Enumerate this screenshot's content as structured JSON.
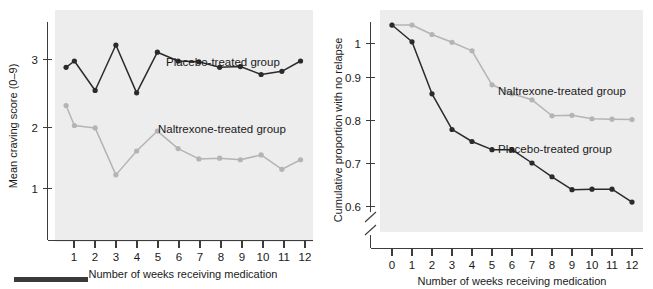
{
  "figure": {
    "background_color": "#ffffff",
    "plot_background_color": "#ededed",
    "caption_bar_label": "caption-rule"
  },
  "colors": {
    "placebo": "#2b2b2b",
    "naltrexone": "#b4b4b4",
    "axis": "#3c3c3c",
    "plot_bg": "#ededed"
  },
  "chart_data": [
    {
      "id": "craving-score-chart",
      "type": "line",
      "title": "",
      "xlabel": "Number of weeks receiving medication",
      "ylabel": "Mean craving score (0–9)",
      "x": [
        1,
        2,
        3,
        4,
        5,
        6,
        7,
        8,
        9,
        10,
        11,
        12
      ],
      "xticks": [
        "1",
        "2",
        "3",
        "4",
        "5",
        "6",
        "7",
        "8",
        "9",
        "10",
        "11",
        "12"
      ],
      "yticks": [
        "1",
        "2",
        "3"
      ],
      "ytickvals": [
        1,
        2,
        3
      ],
      "xlim": [
        0.5,
        12.5
      ],
      "ylim": [
        0.45,
        3.3
      ],
      "grid": false,
      "legend_position": "inline-annotation",
      "series": [
        {
          "name": "Placebo-treated group",
          "color": "#2b2b2b",
          "values": [
            2.58,
            2.66,
            2.29,
            2.86,
            2.26,
            2.77,
            2.66,
            2.65,
            2.58,
            2.59,
            2.49,
            2.53,
            2.66
          ],
          "x": [
            0.6,
            1,
            2,
            3,
            4,
            5,
            6,
            7,
            8,
            9,
            10,
            11,
            11.9
          ],
          "annotation": "Placebo-treated group"
        },
        {
          "name": "Naltrexone-treated group",
          "color": "#b4b4b4",
          "values": [
            2.1,
            1.85,
            1.82,
            1.23,
            1.53,
            1.78,
            1.56,
            1.43,
            1.44,
            1.42,
            1.48,
            1.3,
            1.42
          ],
          "x": [
            0.6,
            1,
            2,
            3,
            4,
            5,
            6,
            7,
            8,
            9,
            10,
            11,
            11.9
          ],
          "annotation": "Naltrexone-treated group"
        }
      ]
    },
    {
      "id": "cumulative-relapse-chart",
      "type": "line",
      "title": "",
      "xlabel": "Number of weeks receiving medication",
      "ylabel": "Cumulative proportion with no relapse",
      "x": [
        0,
        1,
        2,
        3,
        4,
        5,
        6,
        7,
        8,
        9,
        10,
        11,
        12
      ],
      "xticks": [
        "0",
        "1",
        "2",
        "3",
        "4",
        "5",
        "6",
        "7",
        "8",
        "9",
        "10",
        "11",
        "12"
      ],
      "yticks": [
        "0.6",
        "0.7",
        "0.8",
        "0.9",
        "1"
      ],
      "ytickvals": [
        0.6,
        0.7,
        0.8,
        0.9,
        1.0
      ],
      "xlim": [
        -0.55,
        12.55
      ],
      "ylim": [
        0.565,
        1.035
      ],
      "axis_break": true,
      "grid": false,
      "legend_position": "inline-annotation",
      "series": [
        {
          "name": "Naltrexone-treated group",
          "color": "#b4b4b4",
          "values": [
            1.0,
            1.0,
            0.978,
            0.96,
            0.94,
            0.861,
            0.84,
            0.826,
            0.789,
            0.79,
            0.782,
            0.781,
            0.78
          ],
          "annotation": "Naltrexone-treated group"
        },
        {
          "name": "Placebo-treated group",
          "color": "#2b2b2b",
          "values": [
            1.0,
            0.961,
            0.84,
            0.757,
            0.729,
            0.71,
            0.71,
            0.679,
            0.647,
            0.617,
            0.618,
            0.618,
            0.588
          ],
          "annotation": "Placebo-treated group"
        }
      ]
    }
  ],
  "left_chart": {
    "ylabel": "Mean craving score (0–9)",
    "xlabel": "Number of weeks receiving medication",
    "ytick_0": "1",
    "ytick_1": "2",
    "ytick_2": "3",
    "xtick_0": "1",
    "xtick_1": "2",
    "xtick_2": "3",
    "xtick_3": "4",
    "xtick_4": "5",
    "xtick_5": "6",
    "xtick_6": "7",
    "xtick_7": "8",
    "xtick_8": "9",
    "xtick_9": "10",
    "xtick_10": "11",
    "xtick_11": "12",
    "label_placebo": "Placebo-treated group",
    "label_naltrexone": "Naltrexone-treated group"
  },
  "right_chart": {
    "ylabel": "Cumulative proportion with no relapse",
    "xlabel": "Number of weeks receiving medication",
    "ytick_0": "0.6",
    "ytick_1": "0.7",
    "ytick_2": "0.8",
    "ytick_3": "0.9",
    "ytick_4": "1",
    "xtick_0": "0",
    "xtick_1": "1",
    "xtick_2": "2",
    "xtick_3": "3",
    "xtick_4": "4",
    "xtick_5": "5",
    "xtick_6": "6",
    "xtick_7": "7",
    "xtick_8": "8",
    "xtick_9": "9",
    "xtick_10": "10",
    "xtick_11": "11",
    "xtick_12": "12",
    "label_placebo": "Placebo-treated group",
    "label_naltrexone": "Naltrexone-treated group"
  }
}
